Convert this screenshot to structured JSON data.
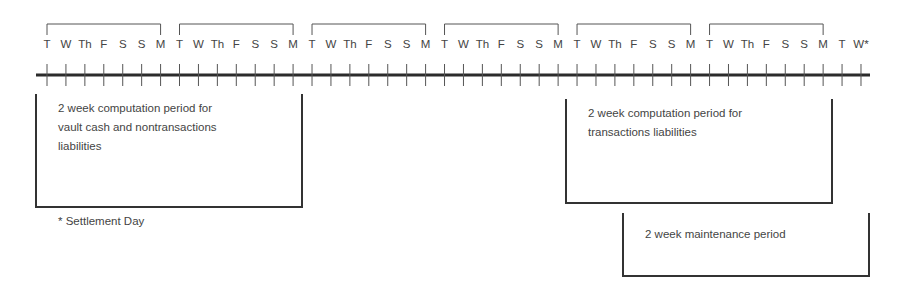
{
  "timeline": {
    "days": [
      "T",
      "W",
      "Th",
      "F",
      "S",
      "S",
      "M",
      "T",
      "W",
      "Th",
      "F",
      "S",
      "S",
      "M",
      "T",
      "W",
      "Th",
      "F",
      "S",
      "S",
      "M",
      "T",
      "W",
      "Th",
      "F",
      "S",
      "S",
      "M",
      "T",
      "W",
      "Th",
      "F",
      "S",
      "S",
      "M",
      "T",
      "W",
      "Th",
      "F",
      "S",
      "S",
      "M",
      "T",
      "W*"
    ],
    "start_x": 47,
    "step_px": 18.93,
    "line_y": 75,
    "line_x_start": 36,
    "line_x_end": 870,
    "week_brackets": 6
  },
  "boxes": {
    "vault_cash": {
      "lines": [
        "2 week computation period for",
        "vault cash and nontransactions",
        "liabilities"
      ]
    },
    "transactions": {
      "lines": [
        "2 week computation period for",
        "transactions liabilities"
      ]
    },
    "maintenance": {
      "lines": [
        "2 week maintenance period"
      ]
    }
  },
  "footnote": "* Settlement Day",
  "colors": {
    "line": "#2b2b2b",
    "text": "#444444"
  }
}
